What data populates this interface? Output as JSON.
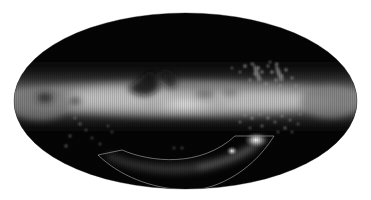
{
  "figure": {
    "type": "all-sky map",
    "projection": "Mollweide (elliptical)",
    "background_color": "#ffffff",
    "sky_background_color": "#000000",
    "band_color_peak": "#e8e8e8",
    "outline_color": "#b0b0b0",
    "ellipse": {
      "cx": 185.5,
      "cy": 101,
      "rx": 171.5,
      "ry": 88
    },
    "features": [
      {
        "name": "galactic-plane-band",
        "description": "bright diffuse band across the middle"
      },
      {
        "name": "dust-lane",
        "description": "dark lane above the band center-left"
      },
      {
        "name": "large-magellanic-cloud",
        "x": 256,
        "y": 140
      },
      {
        "name": "small-magellanic-cloud",
        "x": 232,
        "y": 151
      },
      {
        "name": "magellanic-stream-outline",
        "description": "curved polygon outline at lower half"
      }
    ],
    "outline_region": {
      "inner_arc": [
        [
          122,
          150
        ],
        [
          185,
          163
        ],
        [
          235,
          136
        ]
      ],
      "outer_arc": [
        [
          98,
          155
        ],
        [
          185,
          190
        ],
        [
          274,
          136
        ]
      ]
    }
  }
}
